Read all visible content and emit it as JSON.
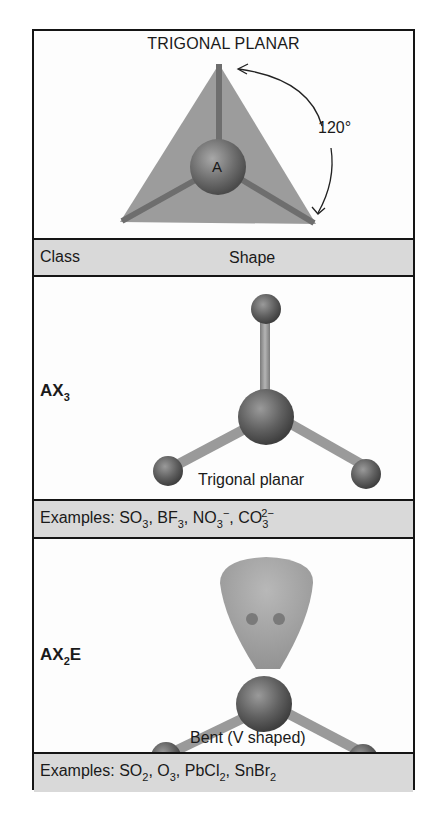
{
  "header_diagram": {
    "title": "TRIGONAL PLANAR",
    "central_atom_label": "A",
    "angle_label": "120°"
  },
  "table_header": {
    "class_label": "Class",
    "shape_label": "Shape"
  },
  "rows": [
    {
      "class": {
        "base": "AX",
        "sub": "3",
        "suffix": ""
      },
      "shape_name": "Trigonal planar",
      "examples_prefix": "Examples: ",
      "examples": [
        {
          "text": "SO",
          "sub": "3",
          "sup": ""
        },
        {
          "text": "BF",
          "sub": "3",
          "sup": ""
        },
        {
          "text": "NO",
          "sub": "3",
          "sup": "−"
        },
        {
          "text": "CO",
          "sub": "3",
          "sup": "2−"
        }
      ]
    },
    {
      "class": {
        "base": "AX",
        "sub": "2",
        "suffix": "E"
      },
      "shape_name": "Bent (V shaped)",
      "examples_prefix": "Examples: ",
      "examples": [
        {
          "text": "SO",
          "sub": "2",
          "sup": ""
        },
        {
          "text": "O",
          "sub": "3",
          "sup": ""
        },
        {
          "text": "PbCl",
          "sub": "2",
          "sup": ""
        },
        {
          "text": "SnBr",
          "sub": "2",
          "sup": ""
        }
      ]
    }
  ],
  "colors": {
    "border": "#151515",
    "band_fill": "#d9d9d9",
    "plane_fill": "#9c9c9c",
    "atom_dark": "#555555",
    "bond": "#8a8a8a",
    "lone_pair": "#a6a6a6"
  }
}
